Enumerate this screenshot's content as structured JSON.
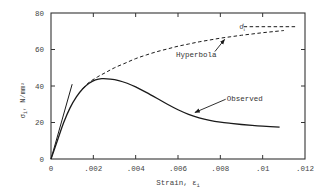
{
  "chart_data": {
    "type": "line",
    "title": "",
    "xlabel": "Strain, ε",
    "xlabel_subscript": "i",
    "ylabel": "σ",
    "ylabel_subscript": "i",
    "ylabel_units": ", N/mm²",
    "xlim": [
      0,
      0.012
    ],
    "ylim": [
      0,
      80
    ],
    "grid": false,
    "legend": null,
    "x_ticks": [
      0,
      0.002,
      0.004,
      0.006,
      0.008,
      0.01,
      0.012
    ],
    "x_tick_labels": [
      "0",
      ".002",
      ".004",
      ".006",
      ".008",
      ".01",
      ".012"
    ],
    "y_ticks": [
      0,
      20,
      40,
      60,
      80
    ],
    "y_tick_labels": [
      "0",
      "20",
      "40",
      "60",
      "80"
    ],
    "series": [
      {
        "name": "Observed",
        "style": "solid",
        "x": [
          0,
          0.0003,
          0.0006,
          0.0009,
          0.0012,
          0.0015,
          0.0018,
          0.0021,
          0.0024,
          0.0028,
          0.0032,
          0.0036,
          0.004,
          0.0045,
          0.005,
          0.0055,
          0.006,
          0.0065,
          0.007,
          0.0075,
          0.008,
          0.0085,
          0.009,
          0.0095,
          0.01,
          0.0108
        ],
        "y": [
          0,
          10,
          20,
          28,
          34,
          38.5,
          41.5,
          43.3,
          44,
          43.8,
          43,
          41.5,
          39.5,
          36.5,
          33.3,
          30,
          27,
          24.5,
          22.6,
          21.2,
          20.2,
          19.5,
          18.9,
          18.4,
          18,
          17.5
        ]
      },
      {
        "name": "Hyperbola",
        "style": "dashed",
        "x": [
          0.0015,
          0.0018,
          0.0022,
          0.0026,
          0.003,
          0.0035,
          0.004,
          0.0045,
          0.005,
          0.0055,
          0.006,
          0.0065,
          0.007,
          0.0075,
          0.008,
          0.0085,
          0.009,
          0.0095,
          0.01,
          0.0105,
          0.011
        ],
        "y": [
          38.5,
          42,
          45,
          47.5,
          50,
          52.5,
          55,
          57,
          58.8,
          60.3,
          61.8,
          63,
          64.2,
          65.2,
          66.2,
          67,
          67.8,
          68.5,
          69.2,
          69.8,
          70.4
        ]
      },
      {
        "name": "Initial tangent",
        "style": "solid-thin",
        "x": [
          0,
          0.001
        ],
        "y": [
          0,
          41
        ]
      },
      {
        "name": "σ_i^f asymptote",
        "style": "dashed",
        "x": [
          0.0091,
          0.0116
        ],
        "y": [
          72.5,
          72.5
        ]
      }
    ],
    "annotations": [
      {
        "text": "Hyperbola",
        "x": 0.0059,
        "y": 57.5,
        "arrow_to": [
          0.0082,
          65.5
        ]
      },
      {
        "text": "Observed",
        "x": 0.0083,
        "y": 33,
        "arrow_to": [
          0.0068,
          25.5
        ]
      },
      {
        "text": "σ",
        "superscript": "f",
        "subscript": "i",
        "x": 0.0089,
        "y": 72.5
      }
    ]
  },
  "colors": {
    "line": "#1a1a1a",
    "axis": "#333333",
    "text": "#444444",
    "background": "#ffffff"
  }
}
